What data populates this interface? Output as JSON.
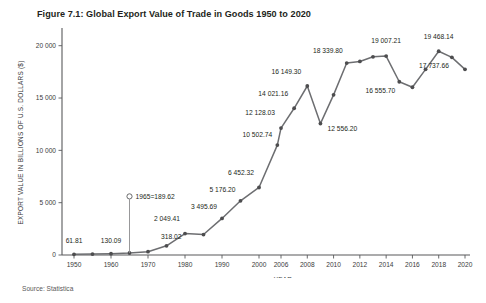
{
  "figure": {
    "title": "Figure 7.1: Global Export Value of Trade in Goods 1950 to 2020",
    "source": "Source: Statistica"
  },
  "chart_data": {
    "type": "line",
    "title": "Figure 7.1: Global Export Value of Trade in Goods 1950 to 2020",
    "xlabel": "YEAR",
    "ylabel": "EXPORT VALUE IN BILLIONS OF U.S. DOLLARS ($)",
    "xlim": [
      1948,
      2021
    ],
    "ylim": [
      0,
      21500
    ],
    "grid": false,
    "legend": null,
    "yticks": [
      0,
      5000,
      10000,
      15000,
      20000
    ],
    "ytick_labels": [
      "0",
      "5 000",
      "10 000",
      "15 000",
      "20 000"
    ],
    "xticks": [
      1950,
      1960,
      1970,
      1980,
      1990,
      2000,
      2006,
      2008,
      2010,
      2012,
      2014,
      2016,
      2018,
      2020
    ],
    "xtick_labels": [
      "1950",
      "1960",
      "1970",
      "1980",
      "1990",
      "2000",
      "2006",
      "2008",
      "2010",
      "2012",
      "2014",
      "2016",
      "2018",
      "2020"
    ],
    "x": [
      1950,
      1955,
      1960,
      1965,
      1970,
      1975,
      1980,
      1985,
      1990,
      1995,
      2000,
      2005,
      2006,
      2007,
      2008,
      2009,
      2010,
      2011,
      2012,
      2013,
      2014,
      2015,
      2016,
      2017,
      2018,
      2019,
      2020
    ],
    "values": [
      61.81,
      93.0,
      130.09,
      189.62,
      318.02,
      877.0,
      2049.41,
      1954.0,
      3495.69,
      5176.2,
      6452.32,
      10502.74,
      12128.03,
      14021.16,
      16149.3,
      12556.2,
      15301.0,
      18339.8,
      18495.0,
      18940.0,
      19007.21,
      16555.7,
      16031.0,
      17737.66,
      19468.14,
      18888.0,
      17737.66
    ],
    "point_labels": [
      {
        "year": 1950,
        "text": "61.81"
      },
      {
        "year": 1960,
        "text": "130.09"
      },
      {
        "year": 1970,
        "text": "318.02"
      },
      {
        "year": 1980,
        "text": "2 049.41"
      },
      {
        "year": 1990,
        "text": "3 495.69"
      },
      {
        "year": 1995,
        "text": "5 176.20"
      },
      {
        "year": 2000,
        "text": "6 452.32"
      },
      {
        "year": 2005,
        "text": "10 502.74"
      },
      {
        "year": 2006,
        "text": "12 128.03"
      },
      {
        "year": 2007,
        "text": "14 021.16"
      },
      {
        "year": 2008,
        "text": "16 149.30"
      },
      {
        "year": 2009,
        "text": "12 556.20"
      },
      {
        "year": 2011,
        "text": "18 339.80"
      },
      {
        "year": 2014,
        "text": "19 007.21"
      },
      {
        "year": 2015,
        "text": "16 555.70"
      },
      {
        "year": 2018,
        "text": "19 468.14"
      },
      {
        "year": 2019,
        "text": "17 737.66"
      }
    ],
    "annotation": {
      "text": "1965=189.62",
      "year": 1965,
      "value": 189.62
    }
  }
}
